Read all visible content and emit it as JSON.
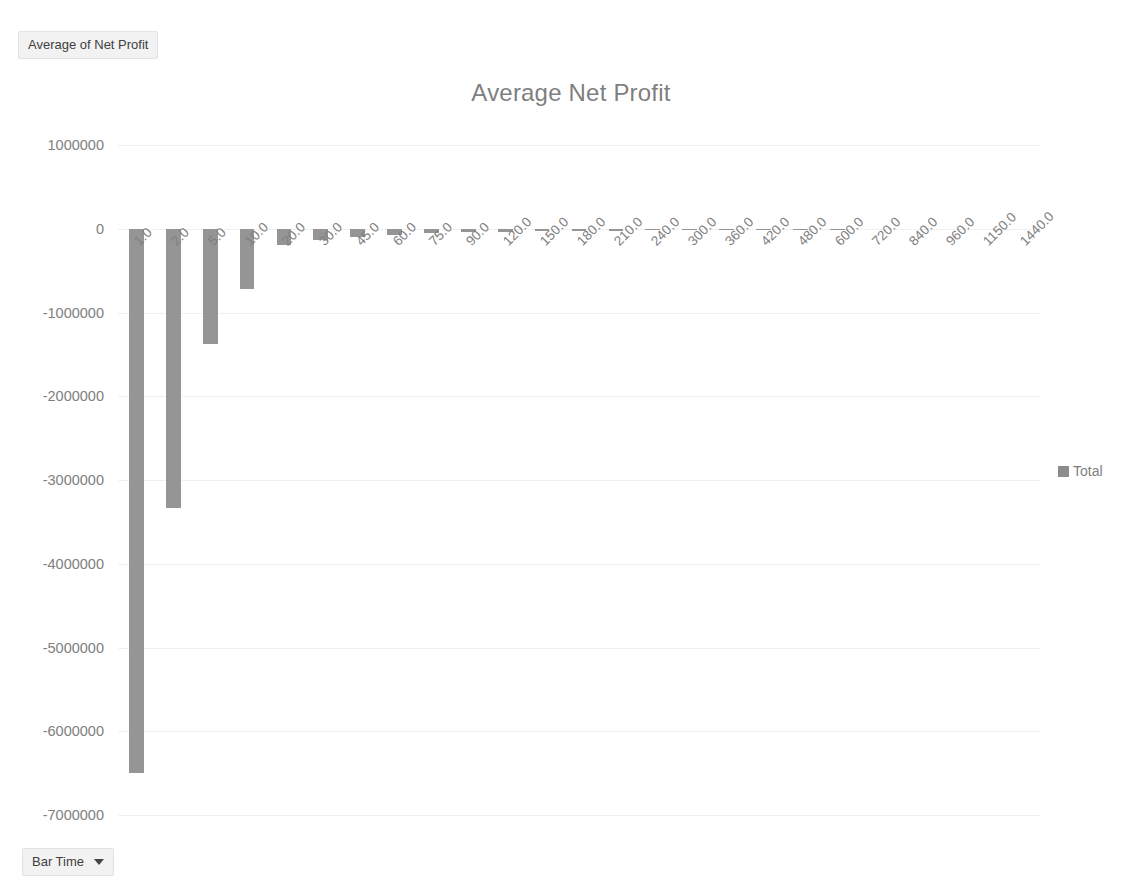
{
  "value_field_button": {
    "label": "Average of Net Profit"
  },
  "axis_field_button": {
    "label": "Bar Time",
    "caret_icon": "chevron-down-icon"
  },
  "legend": {
    "position": "right",
    "entries": [
      {
        "label": "Total",
        "color": "#8c8c8c",
        "marker": "square"
      }
    ]
  },
  "colors": {
    "bar": "#8c8c8c",
    "gridline": "#f0f0f0",
    "title_text": "#7f7f7f",
    "tick_text": "#808080",
    "field_button_bg": "#f2f2f2",
    "plot_background": "#ffffff"
  },
  "chart_data": {
    "type": "bar",
    "title": "Average Net Profit",
    "xlabel": "",
    "ylabel": "",
    "ylim": [
      -7000000,
      1000000
    ],
    "ytick_labels": [
      "1000000",
      "0",
      "-1000000",
      "-2000000",
      "-3000000",
      "-4000000",
      "-5000000",
      "-6000000",
      "-7000000"
    ],
    "ytick_values": [
      1000000,
      0,
      -1000000,
      -2000000,
      -3000000,
      -4000000,
      -5000000,
      -6000000,
      -7000000
    ],
    "grid": true,
    "grid_axis": "y",
    "legend_position": "right",
    "categories": [
      "1.0",
      "2.0",
      "5.0",
      "10.0",
      "20.0",
      "30.0",
      "45.0",
      "60.0",
      "75.0",
      "90.0",
      "120.0",
      "150.0",
      "180.0",
      "210.0",
      "240.0",
      "300.0",
      "360.0",
      "420.0",
      "480.0",
      "600.0",
      "720.0",
      "840.0",
      "960.0",
      "1150.0",
      "1440.0"
    ],
    "series": [
      {
        "name": "Total",
        "values": [
          -6500000,
          -3330000,
          -1380000,
          -720000,
          -190000,
          -140000,
          -95000,
          -70000,
          -50000,
          -42000,
          -33000,
          -28000,
          -24000,
          -21000,
          -19000,
          -17000,
          -15000,
          -13000,
          -12000,
          -9000,
          0,
          0,
          0,
          0,
          0
        ]
      }
    ]
  }
}
